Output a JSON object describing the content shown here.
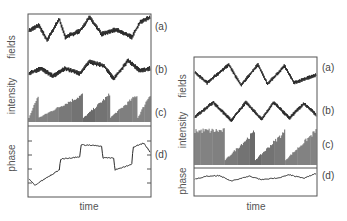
{
  "figure": {
    "panels": [
      {
        "id": "left",
        "y_labels": [
          "fields",
          "intensity",
          "phase"
        ],
        "trace_labels": [
          "(a)",
          "(b)",
          "(c)",
          "(d)"
        ],
        "x_label": "time"
      },
      {
        "id": "right",
        "y_labels": [
          "fields",
          "intensity",
          "phase"
        ],
        "trace_labels": [
          "(a)",
          "(b)",
          "(c)",
          "(d)"
        ],
        "x_label": "time"
      }
    ],
    "colors": {
      "trace": "#2a2a2a",
      "frame": "#555555",
      "background": "#ffffff"
    }
  },
  "chart_data": [
    {
      "type": "line",
      "title": "",
      "xlabel": "time",
      "ylabel": "fields / intensity / phase",
      "grid": false,
      "series": [
        {
          "name": "(a) field",
          "shape": "noisy stepwise switching between high and low plateaus",
          "x": [
            0,
            0.08,
            0.15,
            0.25,
            0.3,
            0.42,
            0.5,
            0.6,
            0.72,
            0.85,
            0.92,
            1.0
          ],
          "values": [
            0.5,
            0.7,
            0.2,
            0.9,
            0.3,
            0.5,
            0.95,
            0.4,
            0.55,
            0.3,
            0.8,
            0.95
          ]
        },
        {
          "name": "(b) field",
          "shape": "noisy stepwise switching, partly anti-correlated with (a)",
          "x": [
            0,
            0.1,
            0.2,
            0.3,
            0.42,
            0.5,
            0.62,
            0.7,
            0.82,
            0.92,
            1.0
          ],
          "values": [
            0.4,
            0.6,
            0.3,
            0.6,
            0.4,
            0.85,
            0.7,
            0.2,
            0.9,
            0.5,
            0.6
          ]
        },
        {
          "name": "(c) intensity",
          "shape": "dense spike trains with growing envelopes, resets near t=0.08, 0.45, 0.67, 0.9"
        },
        {
          "name": "(d) phase",
          "shape": "staircase with drifts; ticks on left axis (4)",
          "x": [
            0,
            0.05,
            0.25,
            0.26,
            0.42,
            0.43,
            0.6,
            0.61,
            0.7,
            0.71,
            0.85,
            0.86,
            0.95,
            1.0
          ],
          "values": [
            0.25,
            0.15,
            0.4,
            0.58,
            0.62,
            0.82,
            0.8,
            0.6,
            0.6,
            0.4,
            0.5,
            0.78,
            0.85,
            0.7
          ]
        }
      ]
    },
    {
      "type": "line",
      "title": "",
      "xlabel": "time",
      "ylabel": "fields / intensity / phase",
      "grid": false,
      "series": [
        {
          "name": "(a) field",
          "shape": "noisy sinusoid, ~4 periods",
          "x": [
            0,
            0.1,
            0.28,
            0.38,
            0.52,
            0.6,
            0.74,
            0.82,
            1.0
          ],
          "values": [
            0.6,
            0.2,
            0.9,
            0.1,
            0.9,
            0.15,
            0.85,
            0.2,
            0.5
          ]
        },
        {
          "name": "(b) field",
          "shape": "noisy sinusoid, ~4 periods, phase-shifted from (a)",
          "x": [
            0,
            0.15,
            0.3,
            0.42,
            0.55,
            0.65,
            0.78,
            0.9,
            1.0
          ],
          "values": [
            0.3,
            0.9,
            0.15,
            0.9,
            0.2,
            0.9,
            0.25,
            0.85,
            0.4
          ]
        },
        {
          "name": "(c) intensity",
          "shape": "first full spike burst, then three ramping envelopes resetting at t≈0.25, 0.5, 0.75"
        },
        {
          "name": "(d) phase",
          "shape": "small slow wiggle",
          "x": [
            0,
            0.1,
            0.2,
            0.3,
            0.45,
            0.55,
            0.7,
            0.78,
            0.9,
            1.0
          ],
          "values": [
            0.5,
            0.7,
            0.75,
            0.35,
            0.7,
            0.45,
            0.6,
            0.8,
            0.55,
            0.9
          ]
        }
      ]
    }
  ]
}
